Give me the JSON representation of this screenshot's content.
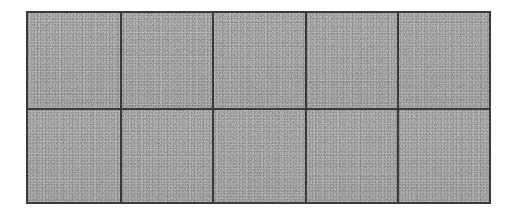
{
  "canvas": {
    "width": 517,
    "height": 216,
    "background_color": "#ffffff"
  },
  "panel": {
    "name": "textured-tile-grid",
    "columns": 5,
    "rows": 2,
    "cell_count": 10,
    "left": 26,
    "top": 11,
    "width": 465,
    "height": 193,
    "border_color": "#3a3a3a",
    "border_width_px": 2,
    "divider_color": "#3a3a3a",
    "divider_width_px": 2,
    "fill_base_color": "#b6b6b6",
    "speckle_dark_color": "#6e6e6e",
    "speckle_light_color": "#d2d2d2",
    "texture_name": "gray-speckle-noise"
  },
  "cells": [
    {
      "id": "cell-r1c1",
      "row": 1,
      "col": 1,
      "label": ""
    },
    {
      "id": "cell-r1c2",
      "row": 1,
      "col": 2,
      "label": ""
    },
    {
      "id": "cell-r1c3",
      "row": 1,
      "col": 3,
      "label": ""
    },
    {
      "id": "cell-r1c4",
      "row": 1,
      "col": 4,
      "label": ""
    },
    {
      "id": "cell-r1c5",
      "row": 1,
      "col": 5,
      "label": ""
    },
    {
      "id": "cell-r2c1",
      "row": 2,
      "col": 1,
      "label": ""
    },
    {
      "id": "cell-r2c2",
      "row": 2,
      "col": 2,
      "label": ""
    },
    {
      "id": "cell-r2c3",
      "row": 2,
      "col": 3,
      "label": ""
    },
    {
      "id": "cell-r2c4",
      "row": 2,
      "col": 4,
      "label": ""
    },
    {
      "id": "cell-r2c5",
      "row": 2,
      "col": 5,
      "label": ""
    }
  ]
}
